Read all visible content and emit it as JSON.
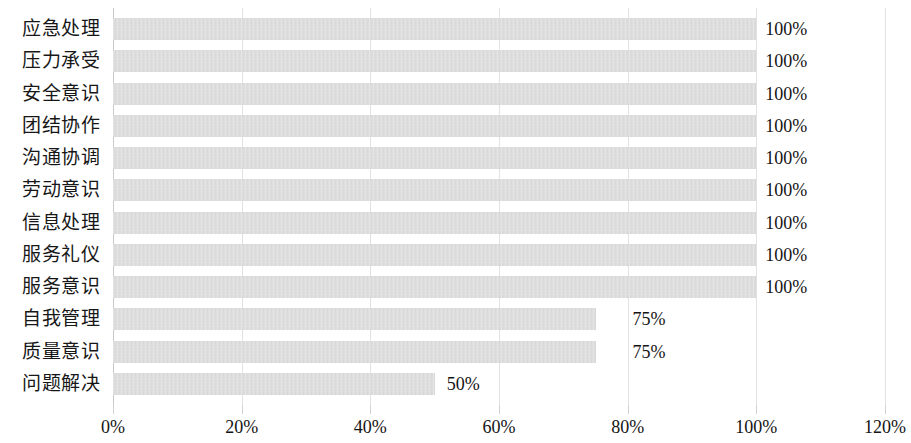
{
  "chart_data": {
    "type": "bar",
    "orientation": "horizontal",
    "title": "",
    "subtitle": "",
    "xlabel": "",
    "ylabel": "",
    "xlim": [
      0,
      120
    ],
    "x_tick_labels": [
      "0%",
      "20%",
      "40%",
      "60%",
      "80%",
      "100%",
      "120%"
    ],
    "x_ticks": [
      0,
      20,
      40,
      60,
      80,
      100,
      120
    ],
    "grid": true,
    "legend": "none",
    "categories": [
      "应急处理",
      "压力承受",
      "安全意识",
      "团结协作",
      "沟通协调",
      "劳动意识",
      "信息处理",
      "服务礼仪",
      "服务意识",
      "自我管理",
      "质量意识",
      "问题解决"
    ],
    "values": [
      100,
      100,
      100,
      100,
      100,
      100,
      100,
      100,
      100,
      75,
      75,
      50
    ],
    "data_labels": [
      "100%",
      "100%",
      "100%",
      "100%",
      "100%",
      "100%",
      "100%",
      "100%",
      "100%",
      "75%",
      "75%",
      "50%"
    ],
    "bar_color": "#d9d9d9",
    "gridline_color": "#e2e2e2",
    "text_color": "#141414"
  }
}
